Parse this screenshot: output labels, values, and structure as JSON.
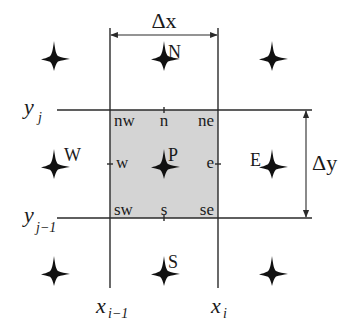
{
  "diagram": {
    "colors": {
      "background": "#ffffff",
      "cell_fill": "#d4d4d4",
      "line": "#2a2a2a",
      "node_marker": "#111111"
    },
    "grid": {
      "x_lines": [
        {
          "id": "x_im1",
          "pos": 110,
          "label": "x",
          "subscript": "i−1"
        },
        {
          "id": "x_i",
          "pos": 218,
          "label": "x",
          "subscript": "i"
        }
      ],
      "y_lines": [
        {
          "id": "y_j",
          "pos": 110,
          "label": "y",
          "subscript": "j"
        },
        {
          "id": "y_jm1",
          "pos": 218,
          "label": "y",
          "subscript": "j−1"
        }
      ]
    },
    "dimensions": {
      "dx_label": "Δx",
      "dy_label": "Δy"
    },
    "nodes": {
      "center": "P",
      "north": "N",
      "south": "S",
      "east": "E",
      "west": "W"
    },
    "faces": {
      "nw": "nw",
      "n": "n",
      "ne": "ne",
      "w": "w",
      "e": "e",
      "sw": "sw",
      "s": "s",
      "se": "se"
    },
    "node_markers": [
      {
        "name": "node-marker-northwest",
        "x": 54,
        "y": 58
      },
      {
        "name": "node-marker-north",
        "x": 164,
        "y": 58
      },
      {
        "name": "node-marker-northeast",
        "x": 272,
        "y": 58
      },
      {
        "name": "node-marker-west",
        "x": 54,
        "y": 166
      },
      {
        "name": "node-marker-center",
        "x": 164,
        "y": 166
      },
      {
        "name": "node-marker-east",
        "x": 272,
        "y": 166
      },
      {
        "name": "node-marker-southwest",
        "x": 54,
        "y": 273
      },
      {
        "name": "node-marker-south",
        "x": 164,
        "y": 273
      },
      {
        "name": "node-marker-southeast",
        "x": 272,
        "y": 273
      }
    ]
  }
}
